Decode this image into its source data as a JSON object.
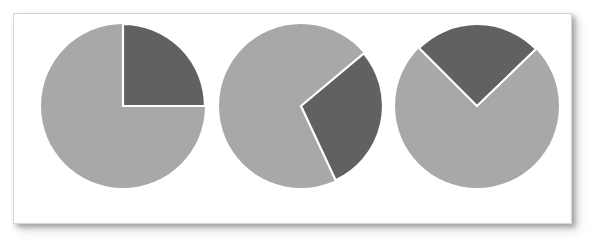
{
  "figure": {
    "background_color": "#ffffff",
    "panel": {
      "background_color": "#ffffff",
      "border_color": "#d6d6d6",
      "shadow_color": "#5a5a5a"
    }
  },
  "palette": {
    "light_slice": "#a8a8a8",
    "dark_slice": "#616161",
    "separator": "#ffffff"
  },
  "chart_data": [
    {
      "type": "pie",
      "title": "",
      "subtitle": "",
      "labels": [
        "highlighted",
        "remainder"
      ],
      "values": [
        25,
        75
      ],
      "colors": [
        "#616161",
        "#a8a8a8"
      ],
      "start_angle_deg": 0,
      "end_angle_deg": 90,
      "sweep_deg": 90,
      "direction": "clockwise",
      "legend": "none",
      "grid": false,
      "annotations": []
    },
    {
      "type": "pie",
      "title": "",
      "subtitle": "",
      "labels": [
        "highlighted",
        "remainder"
      ],
      "values": [
        29,
        71
      ],
      "colors": [
        "#616161",
        "#a8a8a8"
      ],
      "start_angle_deg": 50,
      "end_angle_deg": 155,
      "sweep_deg": 105,
      "direction": "clockwise",
      "legend": "none",
      "grid": false,
      "annotations": []
    },
    {
      "type": "pie",
      "title": "",
      "subtitle": "",
      "labels": [
        "highlighted",
        "remainder"
      ],
      "values": [
        25,
        75
      ],
      "colors": [
        "#616161",
        "#a8a8a8"
      ],
      "start_angle_deg": -45,
      "end_angle_deg": 46,
      "sweep_deg": 91,
      "direction": "clockwise",
      "legend": "none",
      "grid": false,
      "annotations": []
    }
  ]
}
